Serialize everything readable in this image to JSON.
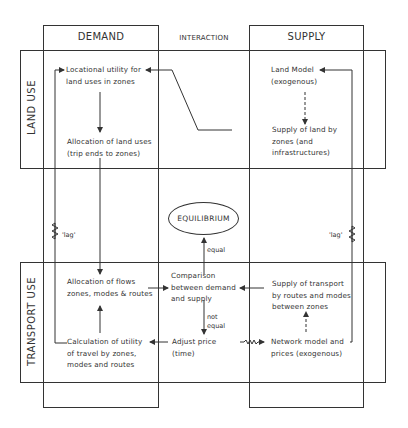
{
  "diagram": {
    "columns": {
      "demand": "DEMAND",
      "interaction": "INTERACTION",
      "supply": "SUPPLY"
    },
    "rows": {
      "land_use": "LAND USE",
      "transport_use": "TRANSPORT USE"
    },
    "nodes": {
      "locational_utility": [
        "Locational utility for",
        "land uses in zones"
      ],
      "allocation_land": [
        "Allocation of land uses",
        "(trip ends to zones)"
      ],
      "land_model": [
        "Land Model",
        "(exogenous)"
      ],
      "supply_land": [
        "Supply of land by",
        "zones (and",
        "infrastructures)"
      ],
      "equilibrium": "EQUILIBRIUM",
      "allocation_flows": [
        "Allocation of flows",
        "zones, modes & routes"
      ],
      "comparison": [
        "Comparison",
        "between demand",
        "and supply"
      ],
      "supply_transport": [
        "Supply of transport",
        "by routes and modes",
        "between zones"
      ],
      "calculation_utility": [
        "Calculation of utility",
        "of travel by zones,",
        "modes and routes"
      ],
      "adjust_price": [
        "Adjust price",
        "(time)"
      ],
      "network_model": [
        "Network model and",
        "prices (exogenous)"
      ]
    },
    "edge_labels": {
      "equal": "equal",
      "not_equal": [
        "not",
        "equal"
      ],
      "lag_left": "'lag'",
      "lag_right": "'lag'"
    },
    "colors": {
      "line": "#333333",
      "background": "#ffffff"
    }
  }
}
